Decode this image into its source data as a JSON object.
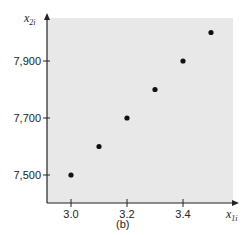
{
  "chart_data": {
    "type": "scatter",
    "title": "",
    "caption": "(b)",
    "xlabel": "x_{1i}",
    "ylabel": "x_{2i}",
    "xlabel_main": "x",
    "xlabel_sub": "1i",
    "ylabel_main": "x",
    "ylabel_sub": "2i",
    "x_ticks": [
      3.0,
      3.2,
      3.4
    ],
    "x_tick_labels": [
      "3.0",
      "3.2",
      "3.4"
    ],
    "y_ticks": [
      7500,
      7700,
      7900
    ],
    "y_tick_labels": [
      "7,500",
      "7,700",
      "7,900"
    ],
    "xlim": [
      2.92,
      3.58
    ],
    "ylim": [
      7405,
      8050
    ],
    "grid": false,
    "legend": null,
    "plot_background": "#e8e8e8",
    "marker_color": "#111111",
    "points": [
      {
        "x": 3.0,
        "y": 7500
      },
      {
        "x": 3.1,
        "y": 7600
      },
      {
        "x": 3.2,
        "y": 7700
      },
      {
        "x": 3.3,
        "y": 7800
      },
      {
        "x": 3.4,
        "y": 7900
      },
      {
        "x": 3.5,
        "y": 8000
      }
    ]
  }
}
